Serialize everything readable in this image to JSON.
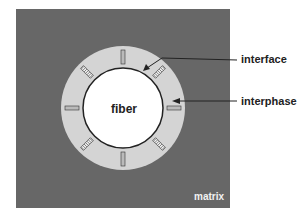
{
  "diagram": {
    "title": "",
    "type": "fiber-interphase-matrix cross-section",
    "colors": {
      "matrix": "#676767",
      "interphase": "#d4d4d4",
      "fiber": "#ffffff",
      "interface_line": "#222222",
      "label_text": "#222222",
      "matrix_label_text": "#f2f2f2"
    },
    "labels": {
      "fiber": "fiber",
      "interface": "interface",
      "interphase": "interphase",
      "matrix": "matrix"
    },
    "geometry": {
      "matrix_box": {
        "x": 16,
        "y": 9,
        "width": 214,
        "height": 199
      },
      "center": {
        "x": 123,
        "y": 108
      },
      "outer_radius": 62,
      "inner_radius": 40,
      "segment_radius": 51,
      "segment_angles_deg": [
        0,
        45,
        90,
        135,
        180,
        225,
        270,
        315
      ]
    }
  }
}
